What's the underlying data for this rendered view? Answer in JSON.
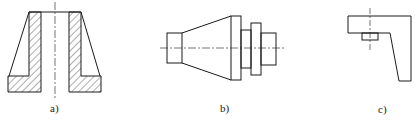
{
  "figures": [
    {
      "id": "a",
      "label": "a)",
      "description": "Section view of tapered bushing with flange and central bore, hatched cut areas"
    },
    {
      "id": "b",
      "label": "b)",
      "description": "Side view of stepped shaft with conical section and two collars"
    },
    {
      "id": "c",
      "label": "c)",
      "description": "L-shaped bracket with tapered leg and small boss"
    }
  ],
  "colors": {
    "line": "#1a1a1a",
    "hatch": "#333333",
    "background": "#ffffff"
  }
}
